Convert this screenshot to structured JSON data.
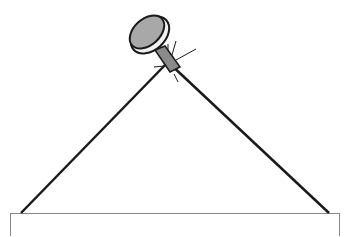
{
  "illustration": {
    "subject": "nail with wire hanging over board",
    "colors": {
      "background": "#ffffff",
      "outline": "#1a1a1a",
      "nail_head_fill": "#a8a8a8",
      "nail_head_rim": "#f2f2f2",
      "nail_shaft_fill": "#8a8a8a",
      "wire": "#1a1a1a",
      "board_stroke": "#888888",
      "board_fill": "#ffffff"
    }
  }
}
